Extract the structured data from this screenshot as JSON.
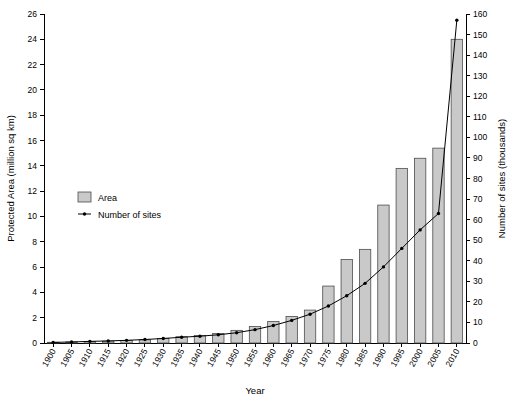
{
  "chart_data": {
    "type": "bar",
    "title": "",
    "subtitle": "",
    "xlabel": "Year",
    "ylabel": "Protected Area (million sq km)",
    "y2label": "Number of sites (thousands)",
    "categories": [
      "1900",
      "1905",
      "1910",
      "1915",
      "1920",
      "1925",
      "1930",
      "1935",
      "1940",
      "1945",
      "1950",
      "1955",
      "1960",
      "1965",
      "1970",
      "1975",
      "1980",
      "1985",
      "1990",
      "1995",
      "2000",
      "2005",
      "2010"
    ],
    "ylim": [
      0,
      26
    ],
    "y2lim": [
      0,
      160
    ],
    "yticks": [
      0,
      2,
      4,
      6,
      8,
      10,
      12,
      14,
      16,
      18,
      20,
      22,
      24,
      26
    ],
    "y2ticks": [
      0,
      10,
      20,
      30,
      40,
      50,
      60,
      70,
      80,
      90,
      100,
      110,
      120,
      130,
      140,
      150,
      160
    ],
    "grid": false,
    "legend_position": "upper-left-inside",
    "series": [
      {
        "name": "Area",
        "type": "bar",
        "axis": "left",
        "unit": "million sq km",
        "color": "#c9c9c9",
        "values": [
          0.05,
          0.08,
          0.12,
          0.15,
          0.2,
          0.25,
          0.35,
          0.5,
          0.6,
          0.75,
          1.0,
          1.3,
          1.7,
          2.1,
          2.6,
          4.5,
          6.6,
          7.4,
          10.9,
          13.8,
          14.6,
          15.4,
          24.0
        ]
      },
      {
        "name": "Number of sites",
        "type": "line",
        "axis": "right",
        "unit": "thousands",
        "color": "#000000",
        "values": [
          0.3,
          0.5,
          0.8,
          1.0,
          1.3,
          1.7,
          2.2,
          2.8,
          3.3,
          4.0,
          5.0,
          6.5,
          8.5,
          11.0,
          14.0,
          18.0,
          23.0,
          29.0,
          37.0,
          46.0,
          55.0,
          63.0,
          157.0
        ]
      }
    ],
    "legend_entries": [
      {
        "label": "Area",
        "marker": "bar",
        "color": "#c9c9c9"
      },
      {
        "label": "Number of sites",
        "marker": "line-point",
        "color": "#000000"
      }
    ]
  }
}
